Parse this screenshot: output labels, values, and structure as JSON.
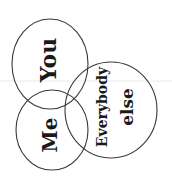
{
  "diagram": {
    "type": "venn",
    "style": "hand-drawn",
    "text_rotation_deg": -90,
    "sets": [
      {
        "id": "you",
        "label": "You",
        "cx": 50,
        "cy": 64,
        "rx": 38,
        "ry": 45
      },
      {
        "id": "me",
        "label": "Me",
        "cx": 52,
        "cy": 130,
        "rx": 36,
        "ry": 40
      },
      {
        "id": "everybody-else",
        "label_line1": "Everybody",
        "label_line2": "else",
        "cx": 111,
        "cy": 110,
        "rx": 46,
        "ry": 48
      }
    ],
    "colors": {
      "stroke": "#3a3a3a",
      "text": "#1a1a1a",
      "background": "#ffffff"
    }
  }
}
